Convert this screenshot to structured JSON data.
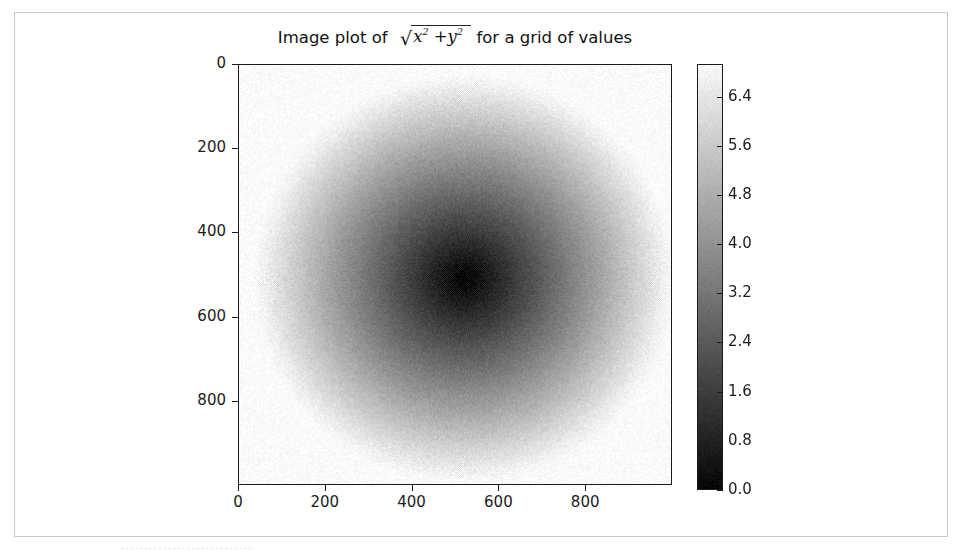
{
  "figure": {
    "title_prefix": "Image plot of",
    "title_radicand_1": "x",
    "title_radicand_exp_1": "2",
    "title_plus": "+",
    "title_radicand_2": "y",
    "title_radicand_exp_2": "2",
    "title_suffix": "for a grid of values",
    "title_plain": "Image plot of sqrt(x^2 + y^2) for a grid of values",
    "radical_sign": "√"
  },
  "caption": {
    "text": "····························"
  },
  "chart_data": {
    "type": "heatmap",
    "xlabel": "",
    "ylabel": "",
    "colormap": "gray",
    "grid": false,
    "origin": "upper",
    "xlim": [
      0,
      1000
    ],
    "ylim": [
      1000,
      0
    ],
    "xticks": [
      0,
      200,
      400,
      600,
      800
    ],
    "yticks": [
      0,
      200,
      400,
      600,
      800
    ],
    "xtick_labels": [
      "0",
      "200",
      "400",
      "600",
      "800"
    ],
    "ytick_labels": [
      "0",
      "200",
      "400",
      "600",
      "800"
    ],
    "value_range": [
      0.0,
      6.93
    ],
    "function": "sqrt(x^2 + y^2)",
    "center_pixel": [
      520,
      510
    ],
    "center_value": 0.0,
    "corner_value_max": 6.93,
    "noise": "dithered halftone texture",
    "colorbar": {
      "position": "right",
      "orientation": "vertical",
      "ticks": [
        0.0,
        0.8,
        1.6,
        2.4,
        3.2,
        4.0,
        4.8,
        5.6,
        6.4
      ],
      "tick_labels": [
        "0.0",
        "0.8",
        "1.6",
        "2.4",
        "3.2",
        "4.0",
        "4.8",
        "5.6",
        "6.4"
      ],
      "vmin": 0.0,
      "vmax": 6.93,
      "low_color": "#000000",
      "high_color": "#ffffff"
    }
  },
  "style": {
    "frame_border": "#c9c9c9",
    "axis_color": "#1a1a1a",
    "text_color": "#1c1c1c",
    "background": "#ffffff"
  }
}
